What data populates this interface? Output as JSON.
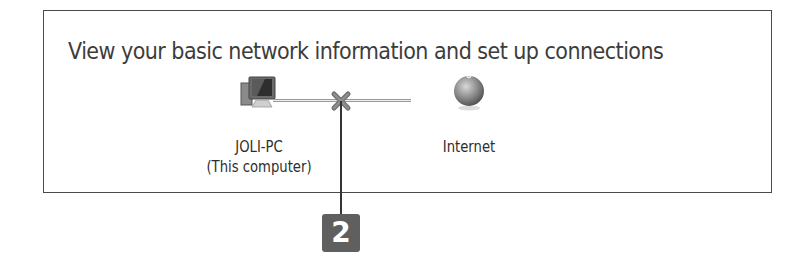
{
  "panel": {
    "title": "View your basic network information and set up connections"
  },
  "nodes": {
    "computer": {
      "icon": "computer-icon",
      "name": "JOLI-PC",
      "subtitle": "(This computer)"
    },
    "internet": {
      "icon": "globe-icon",
      "name": "Internet"
    }
  },
  "connection": {
    "status": "disconnected",
    "icon": "red-x-icon"
  },
  "callout": {
    "number": "2",
    "color": "#5f5f5f"
  }
}
